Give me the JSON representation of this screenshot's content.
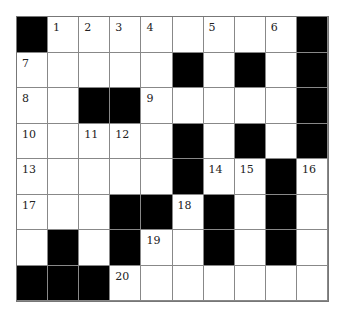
{
  "puzzle": {
    "type": "crossword",
    "rows": 8,
    "cols": 10,
    "grid": [
      [
        "#",
        "1",
        "2",
        "3",
        "4",
        "",
        "5",
        "",
        "6",
        "#"
      ],
      [
        "7",
        "",
        "",
        "",
        "",
        "#",
        "",
        "#",
        "",
        "#"
      ],
      [
        "8",
        "",
        "#",
        "#",
        "9",
        "",
        "",
        "",
        "",
        "#"
      ],
      [
        "10",
        "",
        "11",
        "12",
        "",
        "#",
        "",
        "#",
        "",
        "#"
      ],
      [
        "13",
        "",
        "",
        "",
        "",
        "#",
        "14",
        "15",
        "#",
        "16"
      ],
      [
        "17",
        "",
        "",
        "#",
        "#",
        "18",
        "#",
        "",
        "#",
        ""
      ],
      [
        "",
        "#",
        "",
        "#",
        "19",
        "",
        "#",
        "",
        "#",
        ""
      ],
      [
        "#",
        "#",
        "#",
        "20",
        "",
        "",
        "",
        "",
        "",
        ""
      ]
    ]
  }
}
